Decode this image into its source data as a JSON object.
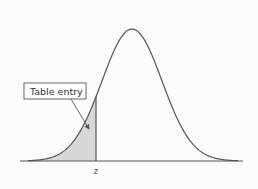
{
  "figure": {
    "type": "standard-normal-distribution",
    "callout_label": "Table entry",
    "axis_marker_label": "z",
    "colors": {
      "curve": "#555555",
      "axis": "#555555",
      "shaded_area": "#d8d8d8",
      "box_border": "#555555",
      "background": "#fbfbfb"
    }
  },
  "chart_data": {
    "type": "area",
    "title": "",
    "xlabel": "",
    "ylabel": "",
    "annotations": [
      {
        "text": "Table entry",
        "points_to": "shaded area left of z"
      },
      {
        "text": "z",
        "position": "x-axis tick at cutoff"
      }
    ],
    "shaded_region": {
      "from": "-inf",
      "to": "z",
      "approx_z": -0.85
    },
    "grid": false,
    "legend": null
  }
}
